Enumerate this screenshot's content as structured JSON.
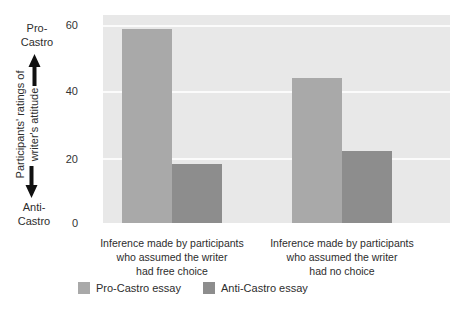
{
  "colors": {
    "pro_bar": "#a9a9a9",
    "anti_bar": "#8d8d8d",
    "plot_background": "#e8e8e8",
    "gridline": "#fbfbfb",
    "text": "#2d2d2d",
    "arrow": "#111111",
    "page_background": "#ffffff"
  },
  "y_axis": {
    "pro_label_line1": "Pro-",
    "pro_label_line2": "Castro",
    "anti_label_line1": "Anti-",
    "anti_label_line2": "Castro",
    "title_line1": "Participants' ratings of",
    "title_line2": "writer's attitude"
  },
  "chart_data": {
    "type": "bar",
    "title": "",
    "xlabel": "",
    "ylabel": "Participants' ratings of writer's attitude (Pro-Castro high, Anti-Castro low)",
    "categories": [
      "Inference made by participants who assumed the writer had free choice",
      "Inference made by participants who assumed the writer had no choice"
    ],
    "category_lines": [
      [
        "Inference made by participants",
        "who assumed the writer",
        "had free choice"
      ],
      [
        "Inference made by participants",
        "who assumed the writer",
        "had no choice"
      ]
    ],
    "series": [
      {
        "name": "Pro-Castro essay",
        "values": [
          59,
          44
        ],
        "color": "#a9a9a9"
      },
      {
        "name": "Anti-Castro essay",
        "values": [
          18,
          22
        ],
        "color": "#8d8d8d"
      }
    ],
    "yticks": [
      0,
      20,
      40,
      60
    ],
    "ylim": [
      0,
      63
    ],
    "grid": true,
    "legend_position": "bottom"
  }
}
